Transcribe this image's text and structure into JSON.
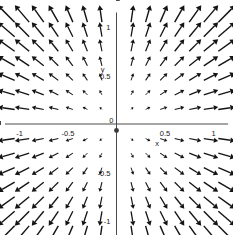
{
  "figure": {
    "kind": "vector-field-plot",
    "background_color": "#ffffff",
    "arrow_color": "#141414",
    "axis_color": "#4a4a4a"
  },
  "axes": {
    "x_name": "x",
    "y_name": "y",
    "x_tick_labels": [
      "-1",
      "-0.5",
      "0",
      "0.5",
      "1"
    ],
    "y_tick_labels": [
      "1",
      "0.5",
      "0",
      "-0.5",
      "-1"
    ],
    "origin_label": "0"
  },
  "chart_data": {
    "type": "scatter",
    "title": "",
    "subtitle": "",
    "xlabel": "x",
    "ylabel": "y",
    "xlim": [
      -1.15,
      1.15
    ],
    "ylim": [
      -1.15,
      1.15
    ],
    "grid": false,
    "legend": null,
    "legend_position": "none",
    "xticks": [
      -1,
      -0.5,
      0,
      0.5,
      1
    ],
    "yticks": [
      -1,
      -0.5,
      0,
      0.5,
      1
    ],
    "xticklabels": [
      "-1",
      "-0.5",
      "0",
      "0.5",
      "1"
    ],
    "yticklabels": [
      "-1",
      "-0.5",
      "0",
      "0.5",
      "1"
    ],
    "minor_tick_step": 0.1,
    "field": {
      "description": "radial outward vector field, arrows point away from the origin with length proportional to distance from origin",
      "u_expression": "x",
      "v_expression": "y",
      "sample_grid_x": [
        -1.05,
        -0.9,
        -0.75,
        -0.6,
        -0.45,
        -0.3,
        -0.15,
        0.15,
        0.3,
        0.45,
        0.6,
        0.75,
        0.9,
        1.05
      ],
      "sample_grid_y": [
        -1.05,
        -0.9,
        -0.75,
        -0.6,
        -0.45,
        -0.3,
        -0.15,
        0.15,
        0.3,
        0.45,
        0.6,
        0.75,
        0.9,
        1.05
      ],
      "arrow_scale": 0.165,
      "quadrant_directions": {
        "I": "northeast",
        "II": "southwest",
        "III": "southwest",
        "IV": "southeast"
      }
    }
  }
}
